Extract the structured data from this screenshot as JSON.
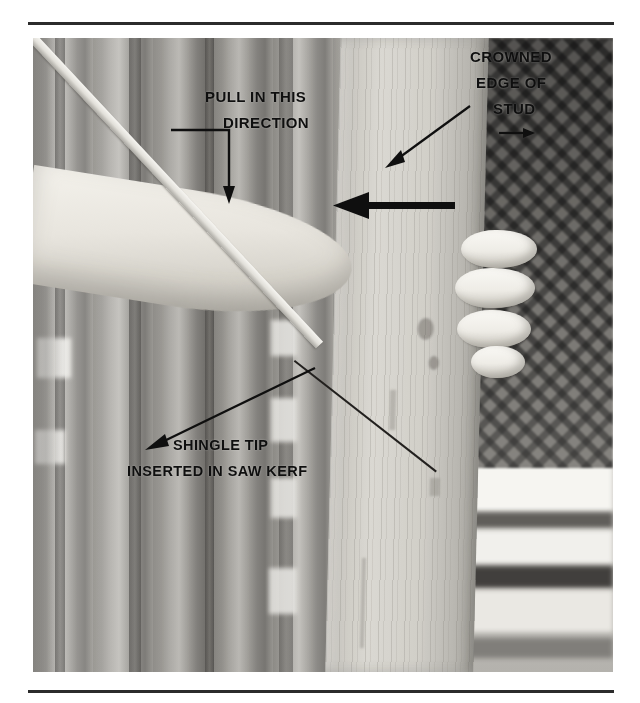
{
  "page": {
    "background_color": "#ffffff",
    "rule_color": "#2b2b2b"
  },
  "figure": {
    "type": "photograph",
    "scene_elements": [
      "vertical wood stud",
      "forearm and hand gripping stud",
      "wooden shingle strip",
      "chain-link fence background",
      "vertical fence boards"
    ]
  },
  "annotations": {
    "pull_direction": {
      "line1": "PULL IN THIS",
      "line2": "DIRECTION",
      "leader": "elbow-leader-down-arrow"
    },
    "crowned_edge": {
      "line1": "CROWNED",
      "line2": "EDGE OF",
      "line3": "STUD",
      "leader": "diagonal-arrow-down-left"
    },
    "shingle_tip": {
      "line1": "SHINGLE TIP",
      "line2": "INSERTED IN SAW KERF",
      "leader": "diagonal-arrow-up-right"
    },
    "force_arrow": {
      "name": "bold-left-pointing-arrow",
      "direction": "left"
    }
  }
}
